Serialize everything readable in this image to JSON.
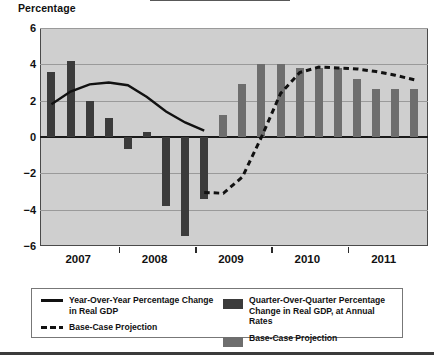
{
  "axis": {
    "ylabel": "Percentage",
    "yticks": [
      "6",
      "4",
      "2",
      "0",
      "-2",
      "-4",
      "-6"
    ],
    "xticklabels": [
      "2007",
      "2008",
      "2009",
      "2010",
      "2011"
    ]
  },
  "legend": {
    "entries": [
      {
        "mark": "solid-line",
        "label": "Year-Over-Year Percentage Change in Real GDP"
      },
      {
        "mark": "dashed-line",
        "label": "Base-Case Projection"
      },
      {
        "mark": "dark-swatch",
        "label": "Quarter-Over-Quarter Percentage Change in Real GDP, at Annual Rates"
      },
      {
        "mark": "mid-swatch",
        "label": "Base-Case Projection"
      }
    ]
  },
  "colors": {
    "plot_background": "#cfcfcf",
    "bar_actual": "#3b3b3b",
    "bar_projection": "#6e6e6e",
    "line": "#111111",
    "gridline": "#9a9a9a"
  },
  "chart_data": {
    "type": "bar",
    "title": "",
    "xlabel": "",
    "ylabel": "Percentage",
    "ylim": [
      -6,
      6
    ],
    "grid": true,
    "legend_position": "below-plot",
    "xtick_values": [
      2007,
      2008,
      2009,
      2010,
      2011
    ],
    "series": [
      {
        "name": "Quarter-Over-Quarter Percentage Change in Real GDP, at Annual Rates",
        "type": "bar",
        "color": "#3b3b3b",
        "x": [
          2006.75,
          2007.0,
          2007.25,
          2007.5,
          2007.75,
          2008.0,
          2008.25,
          2008.5,
          2008.75
        ],
        "values": [
          3.6,
          4.2,
          2.0,
          1.05,
          -0.65,
          0.25,
          -3.8,
          -5.45,
          -3.4
        ]
      },
      {
        "name": "Base-Case Projection (bars)",
        "type": "bar",
        "color": "#6e6e6e",
        "x": [
          2008.75,
          2009.0,
          2009.25,
          2009.5,
          2009.75,
          2010.0,
          2010.25,
          2010.5,
          2010.75,
          2011.0,
          2011.25,
          2011.5
        ],
        "values": [
          -3.4,
          1.2,
          2.9,
          4.0,
          4.0,
          3.8,
          3.8,
          3.8,
          3.2,
          2.65,
          2.65,
          2.65
        ]
      },
      {
        "name": "Year-Over-Year Percentage Change in Real GDP",
        "type": "line",
        "style": "solid",
        "color": "#111111",
        "x": [
          2006.75,
          2007.0,
          2007.25,
          2007.5,
          2007.75,
          2008.0,
          2008.25,
          2008.5,
          2008.75
        ],
        "values": [
          1.8,
          2.5,
          2.9,
          3.0,
          2.85,
          2.2,
          1.4,
          0.8,
          0.35
        ]
      },
      {
        "name": "Base-Case Projection (line)",
        "type": "line",
        "style": "dashed",
        "color": "#111111",
        "x": [
          2008.75,
          2009.0,
          2009.25,
          2009.5,
          2009.75,
          2010.0,
          2010.25,
          2010.5,
          2010.75,
          2011.0,
          2011.25,
          2011.5
        ],
        "values": [
          -3.05,
          -3.1,
          -2.2,
          0.0,
          2.4,
          3.55,
          3.85,
          3.8,
          3.75,
          3.6,
          3.4,
          3.15
        ]
      }
    ]
  }
}
